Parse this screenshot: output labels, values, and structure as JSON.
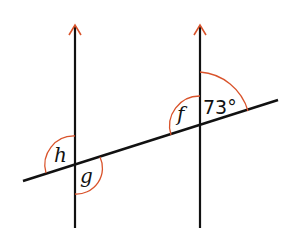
{
  "diagram": {
    "labels": {
      "h": "h",
      "g": "g",
      "f": "f",
      "given_angle": "73°"
    },
    "colors": {
      "line": "#111111",
      "arc": "#d9532b"
    }
  }
}
